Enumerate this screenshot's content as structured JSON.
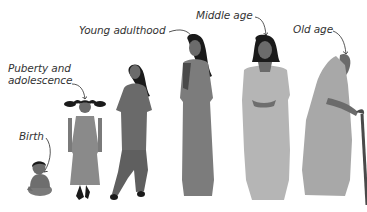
{
  "stages": [
    {
      "id": "birth",
      "label": "Birth",
      "fill": "#6e6e6e",
      "shade": "#5a5a5a"
    },
    {
      "id": "puberty",
      "label_line1": "Puberty and",
      "label_line2": "adolescence",
      "fill": "#8a8a8a",
      "shade": "#777777"
    },
    {
      "id": "young-adulthood",
      "label": "Young adulthood",
      "fill": "#6a6a6a",
      "shade": "#555555"
    },
    {
      "id": "young-adult-saree",
      "fill": "#7c7c7c",
      "shade": "#4a4a4a"
    },
    {
      "id": "middle-age",
      "label": "Middle age",
      "fill": "#b5b5b5",
      "shade": "#6e6e6e"
    },
    {
      "id": "old-age",
      "label": "Old age",
      "fill": "#a8a8a8",
      "shade": "#7a7a7a"
    }
  ],
  "colors": {
    "hair": "#1a1a1a",
    "skin": "#6b6b6b",
    "text": "#333333",
    "arrow": "#444444",
    "background": "#ffffff"
  }
}
